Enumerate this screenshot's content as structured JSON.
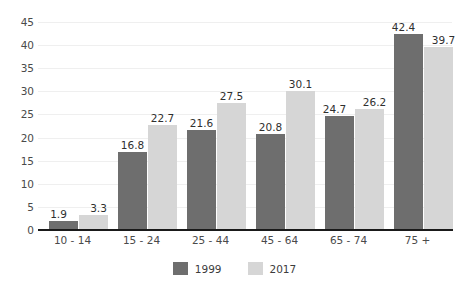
{
  "chart_data": {
    "type": "bar",
    "title": "",
    "subtitle": "",
    "xlabel": "",
    "ylabel": "",
    "categories": [
      "10 - 14",
      "15 - 24",
      "25 - 44",
      "45 - 64",
      "65 - 74",
      "75 +"
    ],
    "series": [
      {
        "name": "1999",
        "color": "#6e6e6e",
        "values": [
          1.9,
          16.8,
          21.6,
          20.8,
          24.7,
          42.4
        ],
        "labels": [
          "1.9",
          "16.8",
          "21.6",
          "20.8",
          "24.7",
          "42.4"
        ]
      },
      {
        "name": "2017",
        "color": "#d6d6d6",
        "values": [
          3.3,
          22.7,
          27.5,
          30.1,
          26.2,
          39.7
        ],
        "labels": [
          "3.3",
          "22.7",
          "27.5",
          "30.1",
          "26.2",
          "39.7"
        ]
      }
    ],
    "ylim": [
      0,
      45
    ],
    "ytick_values": [
      0,
      5,
      10,
      15,
      20,
      25,
      30,
      35,
      40,
      45
    ],
    "ytick_labels": [
      "0",
      "5",
      "10",
      "15",
      "20",
      "25",
      "30",
      "35",
      "40",
      "45"
    ],
    "grid": true,
    "grid_axis": "y",
    "grid_color": "#efefef",
    "legend_position": "bottom-center",
    "background_color": "#ffffff",
    "axis_color": "#1a1a1a"
  },
  "legend": {
    "items": [
      {
        "label": "1999",
        "color": "#6e6e6e"
      },
      {
        "label": "2017",
        "color": "#d6d6d6"
      }
    ]
  }
}
